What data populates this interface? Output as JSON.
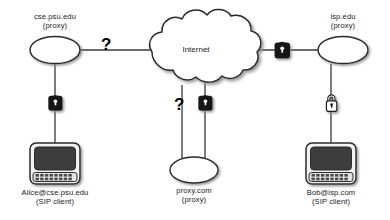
{
  "diagram": {
    "colors": {
      "line": "#3a3a3a",
      "shape_fill": "#ffffff",
      "shape_stroke": "#2b2b2b",
      "lock_dark": "#171717",
      "lock_light": "#ffffff",
      "screen": "#3c3c3c",
      "text": "#1a1a1a",
      "shadow": "#9a9a9a"
    },
    "cloud": {
      "label": "Internet"
    },
    "nodes": [
      {
        "id": "cse-proxy",
        "type": "ellipse-proxy",
        "line1": "cse.psu.edu",
        "line2": "(proxy)"
      },
      {
        "id": "isp-proxy",
        "type": "ellipse-proxy",
        "line1": "isp.edu",
        "line2": "(proxy)"
      },
      {
        "id": "proxy-com",
        "type": "ellipse-proxy",
        "line1": "proxy.com",
        "line2": "(proxy)"
      },
      {
        "id": "alice-client",
        "type": "computer-terminal",
        "line1": "Alice@cse.psu.edu",
        "line2": "(SIP client)"
      },
      {
        "id": "bob-client",
        "type": "computer-terminal",
        "line1": "Bob@isp.com",
        "line2": "(SIP client)"
      }
    ],
    "link_markers": [
      {
        "id": "marker-cse-internet",
        "kind": "question-mark",
        "glyph": "?"
      },
      {
        "id": "marker-internet-isp",
        "kind": "closed-padlock-dark"
      },
      {
        "id": "marker-alice-cse",
        "kind": "closed-padlock-dark"
      },
      {
        "id": "marker-proxycom-internet-left",
        "kind": "question-mark",
        "glyph": "?"
      },
      {
        "id": "marker-proxycom-internet-right",
        "kind": "closed-padlock-dark"
      },
      {
        "id": "marker-isp-bob",
        "kind": "open-padlock-light"
      }
    ]
  }
}
